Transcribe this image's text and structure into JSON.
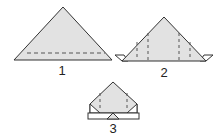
{
  "diagram": {
    "type": "origami-fold-steps",
    "steps": [
      {
        "label": "1",
        "description": "Triangle with dashed fold line along base"
      },
      {
        "label": "2",
        "description": "Triangle with side flaps and four vertical dashed fold lines"
      },
      {
        "label": "3",
        "description": "Pentagon shape with folded bottom band and two dashed fold lines"
      }
    ],
    "colors": {
      "fill": "#e2e2e2",
      "stroke": "#333333",
      "background": "#ffffff"
    }
  }
}
